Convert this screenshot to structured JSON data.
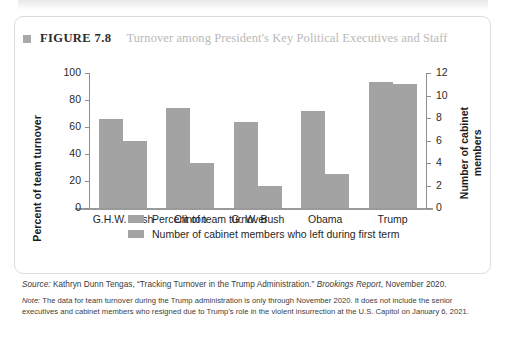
{
  "figure": {
    "bullet_icon": "square-bullet-icon",
    "label": "FIGURE 7.8",
    "title": "Turnover among President's Key Political Executives and Staff"
  },
  "chart_data": {
    "type": "bar",
    "title": "Turnover among President's Key Political Executives and Staff",
    "categories": [
      "G.H.W. Bush",
      "Clinton",
      "G. W. Bush",
      "Obama",
      "Trump"
    ],
    "series": [
      {
        "name": "Percent of team turnover",
        "axis": "left",
        "values": [
          66,
          74,
          64,
          72,
          93
        ],
        "color": "#a3a3a3"
      },
      {
        "name": "Number of cabinet members who left during first term",
        "axis": "right",
        "values": [
          6,
          4,
          2,
          3,
          11
        ],
        "color": "#a3a3a3"
      }
    ],
    "xlabel": "",
    "ylabel": "Percent of team turnover",
    "ylabel_right": "Number of cabinet members",
    "ylim": [
      0,
      100
    ],
    "ylim_right": [
      0,
      12
    ],
    "yticks": [
      0,
      20,
      40,
      60,
      80,
      100
    ],
    "yticks_right": [
      0,
      2,
      4,
      6,
      8,
      10,
      12
    ],
    "grid": false,
    "legend_position": "bottom-left"
  },
  "axes": {
    "left_title": "Percent of team turnover",
    "right_title_line1": "Number of cabinet",
    "right_title_line2": "members",
    "left_ticks": [
      "100",
      "80",
      "60",
      "40",
      "20",
      "0"
    ],
    "right_ticks": [
      "12",
      "10",
      "8",
      "6",
      "4",
      "2",
      "0"
    ]
  },
  "legend": [
    {
      "label": "Percent of team turnover",
      "color": "#a3a3a3"
    },
    {
      "label": "Number of cabinet members who left during first term",
      "color": "#a3a3a3"
    }
  ],
  "footnotes": {
    "source_prefix": "Source:",
    "source_text_a": " Kathryn Dunn Tengas, “Tracking Turnover in the Trump Administration.” ",
    "source_italic": "Brookings Report",
    "source_text_b": ", November 2020.",
    "note_prefix": "Note:",
    "note_text": " The data for team turnover during the Trump administration is only through November 2020. It does not include the senior executives and cabinet members who resigned due to Trump’s role in the violent insurrection at the U.S. Capitol on January 6, 2021."
  }
}
